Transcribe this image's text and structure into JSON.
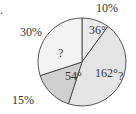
{
  "chart_data": {
    "type": "pie",
    "title": "",
    "slices": [
      {
        "inner_label": "36°",
        "outer_label": "10%",
        "degrees": 36,
        "percent": 10,
        "color": "#ebebeb"
      },
      {
        "inner_label": "162°",
        "outer_label": "?",
        "degrees": 162,
        "percent": 45,
        "color": "#e4e4e4"
      },
      {
        "inner_label": "54°",
        "outer_label": "15%",
        "degrees": 54,
        "percent": 15,
        "color": "#cfcfcf"
      },
      {
        "inner_label": "?",
        "outer_label": "30%",
        "degrees": 108,
        "percent": 30,
        "color": "#f3f3f3"
      }
    ],
    "start": "top",
    "direction": "clockwise"
  },
  "marker": "."
}
